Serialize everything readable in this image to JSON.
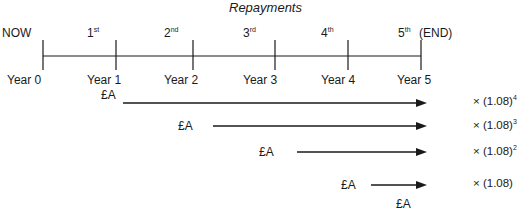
{
  "diagram": {
    "title": "Repayments",
    "now_label": "NOW",
    "end_label": "(END)",
    "repayments": [
      {
        "num": "1",
        "suffix": "st"
      },
      {
        "num": "2",
        "suffix": "nd"
      },
      {
        "num": "3",
        "suffix": "rd"
      },
      {
        "num": "4",
        "suffix": "th"
      },
      {
        "num": "5",
        "suffix": "th"
      }
    ],
    "years": [
      "Year 0",
      "Year 1",
      "Year 2",
      "Year 3",
      "Year 4",
      "Year 5"
    ],
    "amount_label": "£A",
    "compounding": [
      {
        "amount": "£A",
        "from": "Year 1",
        "multiplier_base": "× (1.08)",
        "exponent": "4"
      },
      {
        "amount": "£A",
        "from": "Year 2",
        "multiplier_base": "× (1.08)",
        "exponent": "3"
      },
      {
        "amount": "£A",
        "from": "Year 3",
        "multiplier_base": "× (1.08)",
        "exponent": "2"
      },
      {
        "amount": "£A",
        "from": "Year 4",
        "multiplier_base": "× (1.08)",
        "exponent": ""
      }
    ],
    "final_amount": "£A",
    "line_color": "#1a1a1a"
  }
}
